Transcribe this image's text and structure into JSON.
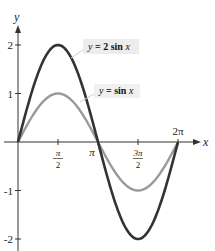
{
  "chart_data": {
    "type": "line",
    "title": "",
    "xlabel": "x",
    "ylabel": "y",
    "xlim": [
      0,
      6.2832
    ],
    "ylim": [
      -2,
      2
    ],
    "grid": false,
    "x_ticks": [
      {
        "value": 1.5708,
        "label_num": "π",
        "label_den": "2"
      },
      {
        "value": 3.1416,
        "label": "π"
      },
      {
        "value": 4.7124,
        "label_num": "3π",
        "label_den": "2"
      },
      {
        "value": 6.2832,
        "label": "2π"
      }
    ],
    "y_ticks": [
      {
        "value": 2,
        "label": "2"
      },
      {
        "value": 1,
        "label": "1"
      },
      {
        "value": -1,
        "label": "-1"
      },
      {
        "value": -2,
        "label": "-2"
      }
    ],
    "series": [
      {
        "name": "y = 2 sin x",
        "label_prefix": "y",
        "label_eq": " = 2 sin ",
        "label_var": "x",
        "color": "#333333",
        "amplitude": 2,
        "x": [
          0,
          0.7854,
          1.5708,
          2.3562,
          3.1416,
          3.927,
          4.7124,
          5.4978,
          6.2832
        ],
        "values": [
          0,
          1.414,
          2,
          1.414,
          0,
          -1.414,
          -2,
          -1.414,
          0
        ]
      },
      {
        "name": "y = sin x",
        "label_prefix": "y",
        "label_eq": " = sin ",
        "label_var": "x",
        "color": "#9a9a9a",
        "amplitude": 1,
        "x": [
          0,
          0.7854,
          1.5708,
          2.3562,
          3.1416,
          3.927,
          4.7124,
          5.4978,
          6.2832
        ],
        "values": [
          0,
          0.707,
          1,
          0.707,
          0,
          -0.707,
          -1,
          -0.707,
          0
        ]
      }
    ]
  },
  "axes": {
    "x_label": "x",
    "y_label": "y"
  }
}
